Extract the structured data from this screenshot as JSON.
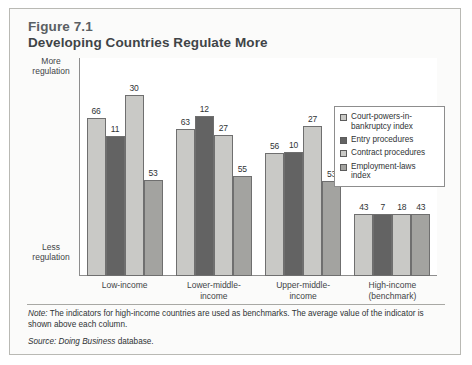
{
  "figure": {
    "number": "Figure 7.1",
    "title": "Developing Countries Regulate More"
  },
  "axis": {
    "top_label": "More\nregulation",
    "top_label_line1": "More",
    "top_label_line2": "regulation",
    "bottom_label_line1": "Less",
    "bottom_label_line2": "regulation"
  },
  "footer": {
    "note_prefix": "Note:",
    "note_text": " The indicators for high-income countries are used as benchmarks. The average value of the indicator is shown above each column.",
    "source_prefix": "Source:",
    "source_italic": " Doing Business",
    "source_text": " database."
  },
  "colors": {
    "series1": "#c9c9c6",
    "series2": "#636363",
    "series3": "#c9c9c6",
    "series4": "#a3a3a0",
    "card_bg": "#fbfbfa",
    "plot_bg": "#ffffff",
    "axis": "#8d8d8d",
    "bar_outline": "#6f6f6f",
    "title_color": "#3f4447"
  },
  "chart_data": {
    "type": "bar",
    "title": "Developing Countries Regulate More",
    "subtitle": "Figure 7.1",
    "xlabel": "",
    "ylabel": "Regulation (More → Less)",
    "grid": false,
    "legend_position": "top-right",
    "note": "Indicator series use independent scales; bar pixel heights are not comparable across series.",
    "categories": [
      "Low-income",
      "Lower-middle-income",
      "Upper-middle-income",
      "High-income (benchmark)"
    ],
    "category_lines": [
      [
        "Low-income"
      ],
      [
        "Lower-middle-",
        "income"
      ],
      [
        "Upper-middle-",
        "income"
      ],
      [
        "High-income",
        "(benchmark)"
      ]
    ],
    "series": [
      {
        "name": "Court-powers-in-bankruptcy index",
        "legend_lines": [
          "Court-powers-in-",
          "bankruptcy index"
        ],
        "color": "#c9c9c6",
        "values": [
          66,
          63,
          56,
          43
        ],
        "bar_heights_px": [
          158,
          147,
          123,
          62
        ]
      },
      {
        "name": "Entry procedures",
        "legend_lines": [
          "Entry procedures"
        ],
        "color": "#636363",
        "values": [
          11,
          12,
          10,
          7
        ],
        "bar_heights_px": [
          140,
          160,
          124,
          62
        ]
      },
      {
        "name": "Contract procedures",
        "legend_lines": [
          "Contract procedures"
        ],
        "color": "#c9c9c6",
        "values": [
          30,
          27,
          27,
          18
        ],
        "bar_heights_px": [
          181,
          141,
          150,
          62
        ]
      },
      {
        "name": "Employment-laws index",
        "legend_lines": [
          "Employment-laws index"
        ],
        "color": "#a3a3a0",
        "values": [
          53,
          55,
          53,
          43
        ],
        "bar_heights_px": [
          96,
          100,
          95,
          62
        ]
      }
    ]
  }
}
